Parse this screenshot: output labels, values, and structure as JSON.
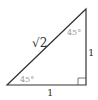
{
  "diagram": {
    "type": "right-triangle",
    "hypotenuse_label": "√2",
    "vertical_leg_label": "1",
    "horizontal_leg_label": "1",
    "top_angle_label": "45°",
    "bottom_angle_label": "45°",
    "right_angle_marker": true,
    "colors": {
      "stroke": "#333333",
      "angle_text": "#999999",
      "background": "#ffffff"
    }
  }
}
